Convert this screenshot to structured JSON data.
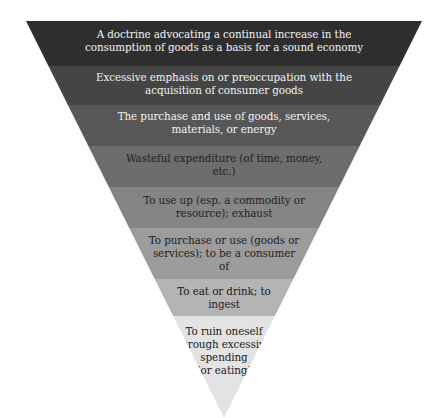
{
  "diagram": {
    "type": "inverted-pyramid",
    "levels": [
      {
        "label": "A doctrine advocating a continual increase in the consumption of goods as a basis for a sound economy",
        "lines": [
          "A doctrine advocating a continual increase in the",
          "consumption of goods as a basis for a sound economy"
        ],
        "color": "#2e2e2e"
      },
      {
        "label": "Excessive emphasis on or preoccupation with the acquisition of consumer goods",
        "lines": [
          "Excessive emphasis on or preoccupation with the",
          "acquisition of consumer goods"
        ],
        "color": "#454545"
      },
      {
        "label": "The purchase and use of goods, services, materials, or energy",
        "lines": [
          "The purchase and use of goods, services,",
          "materials, or energy"
        ],
        "color": "#575757"
      },
      {
        "label": "Wasteful expenditure (of time, money, etc.)",
        "lines": [
          "Wasteful expenditure (of time, money,",
          "etc.)"
        ],
        "color": "#6d6d6d"
      },
      {
        "label": "To use up (esp. a commodity or resource); exhaust",
        "lines": [
          "To use up (esp. a commodity or",
          "resource); exhaust"
        ],
        "color": "#858585"
      },
      {
        "label": "To purchase or use (goods or services); to be a consumer of",
        "lines": [
          "To purchase or use (goods or",
          "services); to be a consumer",
          "of"
        ],
        "color": "#9c9c9c"
      },
      {
        "label": "To eat or drink; to ingest",
        "lines": [
          "To eat or drink; to",
          "ingest"
        ],
        "color": "#b4b4b4"
      },
      {
        "label": "To ruin oneself through excessive spending (or eating)",
        "lines": [
          "To ruin oneself",
          "through excessive",
          "spending",
          "(or eating)"
        ],
        "color": "#e3e3e3"
      }
    ]
  }
}
